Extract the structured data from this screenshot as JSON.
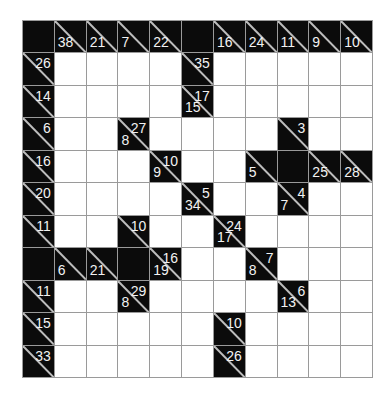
{
  "puzzle": {
    "type": "kakuro",
    "rows": 11,
    "cols": 11,
    "colors": {
      "block": "#0b0b0b",
      "white": "#ffffff",
      "grid_line": "#9a9a9a",
      "clue_text": "#f2f2f2"
    },
    "grid": [
      [
        {
          "t": "B"
        },
        {
          "t": "C",
          "d": "38"
        },
        {
          "t": "C",
          "d": "21"
        },
        {
          "t": "C",
          "d": "7"
        },
        {
          "t": "C",
          "d": "22"
        },
        {
          "t": "B"
        },
        {
          "t": "C",
          "d": "16"
        },
        {
          "t": "C",
          "d": "24"
        },
        {
          "t": "C",
          "d": "11"
        },
        {
          "t": "C",
          "d": "9"
        },
        {
          "t": "C",
          "d": "10"
        }
      ],
      [
        {
          "t": "C",
          "r": "26"
        },
        {
          "t": "W"
        },
        {
          "t": "W"
        },
        {
          "t": "W"
        },
        {
          "t": "W"
        },
        {
          "t": "C",
          "r": "35"
        },
        {
          "t": "W"
        },
        {
          "t": "W"
        },
        {
          "t": "W"
        },
        {
          "t": "W"
        },
        {
          "t": "W"
        }
      ],
      [
        {
          "t": "C",
          "r": "14"
        },
        {
          "t": "W"
        },
        {
          "t": "W"
        },
        {
          "t": "W"
        },
        {
          "t": "W"
        },
        {
          "t": "C",
          "r": "17",
          "d": "15"
        },
        {
          "t": "W"
        },
        {
          "t": "W"
        },
        {
          "t": "W"
        },
        {
          "t": "W"
        },
        {
          "t": "W"
        }
      ],
      [
        {
          "t": "C",
          "r": "6"
        },
        {
          "t": "W"
        },
        {
          "t": "W"
        },
        {
          "t": "C",
          "r": "27",
          "d": "8"
        },
        {
          "t": "W"
        },
        {
          "t": "W"
        },
        {
          "t": "W"
        },
        {
          "t": "W"
        },
        {
          "t": "C",
          "r": "3"
        },
        {
          "t": "W"
        },
        {
          "t": "W"
        }
      ],
      [
        {
          "t": "C",
          "r": "16"
        },
        {
          "t": "W"
        },
        {
          "t": "W"
        },
        {
          "t": "W"
        },
        {
          "t": "C",
          "r": "10",
          "d": "9"
        },
        {
          "t": "W"
        },
        {
          "t": "W"
        },
        {
          "t": "C",
          "d": "5"
        },
        {
          "t": "B"
        },
        {
          "t": "C",
          "d": "25"
        },
        {
          "t": "C",
          "d": "28"
        }
      ],
      [
        {
          "t": "C",
          "r": "20"
        },
        {
          "t": "W"
        },
        {
          "t": "W"
        },
        {
          "t": "W"
        },
        {
          "t": "W"
        },
        {
          "t": "C",
          "r": "5",
          "d": "34"
        },
        {
          "t": "W"
        },
        {
          "t": "W"
        },
        {
          "t": "C",
          "r": "4",
          "d": "7"
        },
        {
          "t": "W"
        },
        {
          "t": "W"
        }
      ],
      [
        {
          "t": "C",
          "r": "11"
        },
        {
          "t": "W"
        },
        {
          "t": "W"
        },
        {
          "t": "C",
          "r": "10"
        },
        {
          "t": "W"
        },
        {
          "t": "W"
        },
        {
          "t": "C",
          "r": "24",
          "d": "17"
        },
        {
          "t": "W"
        },
        {
          "t": "W"
        },
        {
          "t": "W"
        },
        {
          "t": "W"
        }
      ],
      [
        {
          "t": "B"
        },
        {
          "t": "C",
          "d": "6"
        },
        {
          "t": "C",
          "d": "21"
        },
        {
          "t": "B"
        },
        {
          "t": "C",
          "r": "16",
          "d": "19"
        },
        {
          "t": "W"
        },
        {
          "t": "W"
        },
        {
          "t": "C",
          "r": "7",
          "d": "8"
        },
        {
          "t": "W"
        },
        {
          "t": "W"
        },
        {
          "t": "W"
        }
      ],
      [
        {
          "t": "C",
          "r": "11"
        },
        {
          "t": "W"
        },
        {
          "t": "W"
        },
        {
          "t": "C",
          "r": "29",
          "d": "8"
        },
        {
          "t": "W"
        },
        {
          "t": "W"
        },
        {
          "t": "W"
        },
        {
          "t": "W"
        },
        {
          "t": "C",
          "r": "6",
          "d": "13"
        },
        {
          "t": "W"
        },
        {
          "t": "W"
        }
      ],
      [
        {
          "t": "C",
          "r": "15"
        },
        {
          "t": "W"
        },
        {
          "t": "W"
        },
        {
          "t": "W"
        },
        {
          "t": "W"
        },
        {
          "t": "W"
        },
        {
          "t": "C",
          "r": "10"
        },
        {
          "t": "W"
        },
        {
          "t": "W"
        },
        {
          "t": "W"
        },
        {
          "t": "W"
        }
      ],
      [
        {
          "t": "C",
          "r": "33"
        },
        {
          "t": "W"
        },
        {
          "t": "W"
        },
        {
          "t": "W"
        },
        {
          "t": "W"
        },
        {
          "t": "W"
        },
        {
          "t": "C",
          "r": "26"
        },
        {
          "t": "W"
        },
        {
          "t": "W"
        },
        {
          "t": "W"
        },
        {
          "t": "W"
        }
      ]
    ]
  }
}
